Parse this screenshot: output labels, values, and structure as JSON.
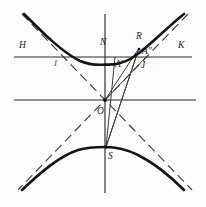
{
  "figure": {
    "type": "geometric-diagram",
    "canvas": {
      "width": 206,
      "height": 207,
      "background": "#fdfdfc"
    },
    "colors": {
      "curve": "#141414",
      "axis": "#2b2b2b",
      "asymptote": "#3d3d3d",
      "chord": "#3a3a3a",
      "label": "#1a1a1a"
    },
    "center": {
      "x": 105,
      "y": 100
    },
    "labels": [
      {
        "id": "H",
        "text": "H",
        "x": 19,
        "y": 48,
        "faint": false
      },
      {
        "id": "I",
        "text": "I",
        "x": 54,
        "y": 66,
        "faint": true
      },
      {
        "id": "N",
        "text": "N",
        "x": 100,
        "y": 45,
        "faint": false
      },
      {
        "id": "R",
        "text": "R",
        "x": 136,
        "y": 39,
        "faint": false
      },
      {
        "id": "A2",
        "text": "A″",
        "x": 142,
        "y": 54,
        "faint": false
      },
      {
        "id": "A1",
        "text": "A′",
        "x": 117,
        "y": 67,
        "faint": false
      },
      {
        "id": "J",
        "text": "J",
        "x": 141,
        "y": 68,
        "faint": false
      },
      {
        "id": "K",
        "text": "K",
        "x": 178,
        "y": 48,
        "faint": false
      },
      {
        "id": "O",
        "text": "O",
        "x": 97,
        "y": 114,
        "faint": false
      },
      {
        "id": "S",
        "text": "S",
        "x": 108,
        "y": 159,
        "faint": false
      }
    ],
    "lines": {
      "x_axis": {
        "x1": 14,
        "y1": 100,
        "x2": 196,
        "y2": 100
      },
      "y_axis": {
        "x1": 105,
        "y1": 14,
        "x2": 105,
        "y2": 193
      },
      "secant_hk": {
        "x1": 14,
        "y1": 57,
        "x2": 192,
        "y2": 57
      },
      "chord_o_r": {
        "x1": 105,
        "y1": 100,
        "x2": 139,
        "y2": 48
      },
      "chord_o_a2": {
        "x1": 105,
        "y1": 100,
        "x2": 146,
        "y2": 57
      },
      "chord_s_a1": {
        "x1": 106,
        "y1": 147,
        "x2": 115,
        "y2": 57
      },
      "chord_s_r": {
        "x1": 106,
        "y1": 147,
        "x2": 139,
        "y2": 48
      },
      "chord_s_j": {
        "x1": 106,
        "y1": 147,
        "x2": 136,
        "y2": 57
      }
    },
    "asymptotes": [
      {
        "id": "asymptote-up-right",
        "x1": 22,
        "y1": 14,
        "x2": 192,
        "y2": 190
      },
      {
        "id": "asymptote-up-left",
        "x1": 188,
        "y1": 14,
        "x2": 18,
        "y2": 190
      }
    ],
    "branches": [
      {
        "id": "upper-branch",
        "vertex_x": 105,
        "vertex_y": 64,
        "direction": "up"
      },
      {
        "id": "lower-branch",
        "vertex_x": 105,
        "vertex_y": 147,
        "direction": "down"
      }
    ],
    "points": [
      {
        "id": "point-O",
        "x": 105,
        "y": 100
      },
      {
        "id": "point-S",
        "x": 106,
        "y": 147
      },
      {
        "id": "point-R",
        "x": 139,
        "y": 48
      }
    ]
  }
}
